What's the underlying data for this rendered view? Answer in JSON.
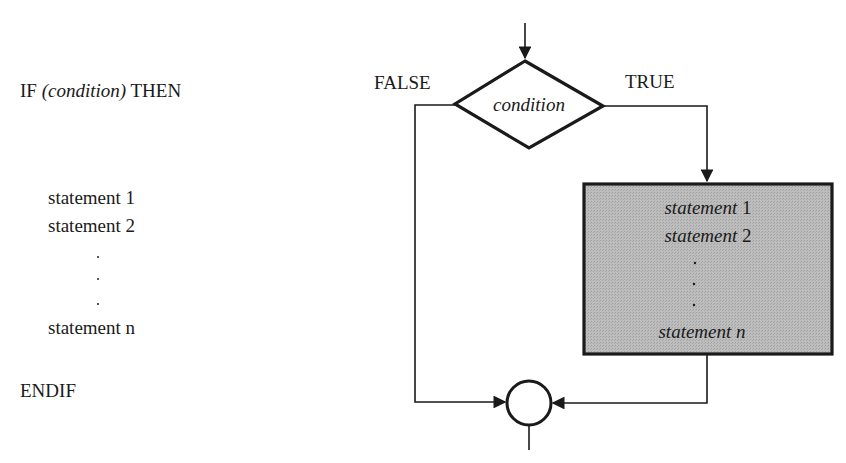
{
  "pseudocode": {
    "if_keyword": "IF",
    "condition": "(condition)",
    "then_keyword": "THEN",
    "statements": [
      "statement 1",
      "statement 2",
      "statement n"
    ],
    "ellipsis": "⋮",
    "endif_keyword": "ENDIF"
  },
  "flowchart": {
    "decision_label": "condition",
    "false_label": "FALSE",
    "true_label": "TRUE",
    "process_box": {
      "lines": [
        {
          "italic": "statement",
          "plain": " 1"
        },
        {
          "italic": "statement",
          "plain": " 2"
        },
        {
          "italic": "statement n",
          "plain": ""
        }
      ],
      "fill": "#b4b4b4",
      "border": "#1a1a1a"
    },
    "connector": "junction-circle",
    "line_color": "#1a1a1a"
  }
}
